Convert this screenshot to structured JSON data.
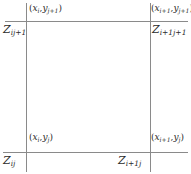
{
  "figure": {
    "line_color": "#8a8a8a",
    "background": "#ffffff"
  },
  "corners": {
    "top_left": {
      "coord_open": "(",
      "coord_x_base": "x",
      "coord_x_sub": "i",
      "coord_comma": ",",
      "coord_y_base": "y",
      "coord_y_sub": "j+1",
      "coord_close": ")",
      "z_base": "Z",
      "z_sub": "ij+1"
    },
    "top_right": {
      "coord_open": "(",
      "coord_x_base": "x",
      "coord_x_sub": "i+1",
      "coord_comma": ",",
      "coord_y_base": "y",
      "coord_y_sub": "j+1",
      "coord_close": ")",
      "z_base": "Z",
      "z_sub": "i+1j+1"
    },
    "bottom_left": {
      "coord_open": "(",
      "coord_x_base": "x",
      "coord_x_sub": "i",
      "coord_comma": ",",
      "coord_y_base": "y",
      "coord_y_sub": "j",
      "coord_close": ")",
      "z_base": "Z",
      "z_sub": "ij"
    },
    "bottom_right": {
      "coord_open": "(",
      "coord_x_base": "x",
      "coord_x_sub": "i+1",
      "coord_comma": ",",
      "coord_y_base": "y",
      "coord_y_sub": "j",
      "coord_close": ")",
      "z_base": "Z",
      "z_sub": "i+1j"
    }
  }
}
